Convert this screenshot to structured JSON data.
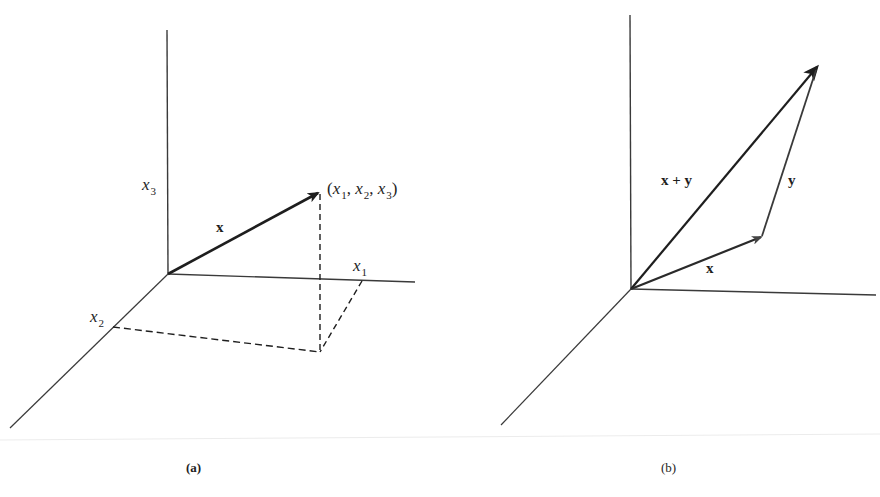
{
  "figure": {
    "panel_a": {
      "caption": "(a)",
      "axis_labels": {
        "x1": {
          "var": "x",
          "sub": "1"
        },
        "x2": {
          "var": "x",
          "sub": "2"
        },
        "x3": {
          "var": "x",
          "sub": "3"
        }
      },
      "vector_label": "x",
      "point_label": {
        "open": "(",
        "v1": "x",
        "s1": "1",
        "sep1": ", ",
        "v2": "x",
        "s2": "2",
        "sep2": ", ",
        "v3": "x",
        "s3": "3",
        "close": ")"
      }
    },
    "panel_b": {
      "caption": "(b)",
      "vector_x_label": "x",
      "vector_y_label": "y",
      "vector_sum_label": "x + y"
    },
    "colors": {
      "ink": "#1e1e1e",
      "axis": "#3a3a3a",
      "background": "#ffffff"
    }
  }
}
